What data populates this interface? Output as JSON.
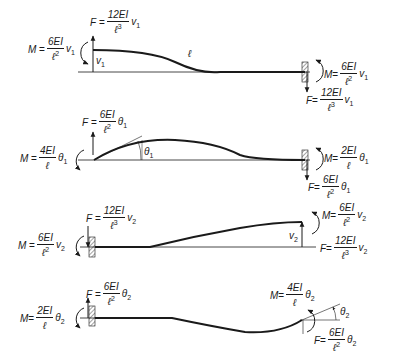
{
  "diagram": {
    "cases": [
      {
        "id": "case1",
        "description": "Left end translation v1, right end fixed",
        "span_label": "ℓ",
        "displacement_label": {
          "sym": "v",
          "sub": "1"
        },
        "left_force": {
          "sym": "F",
          "num": "12EI",
          "den": "ℓ",
          "den_pow": "3",
          "var": "v",
          "var_sub": "1"
        },
        "left_moment": {
          "sym": "M",
          "num": "6EI",
          "den": "ℓ",
          "den_pow": "2",
          "var": "v",
          "var_sub": "1"
        },
        "right_moment": {
          "sym": "M",
          "num": "6EI",
          "den": "ℓ",
          "den_pow": "2",
          "var": "v",
          "var_sub": "1"
        },
        "right_force": {
          "sym": "F",
          "num": "12EI",
          "den": "ℓ",
          "den_pow": "3",
          "var": "v",
          "var_sub": "1"
        }
      },
      {
        "id": "case2",
        "description": "Left end rotation θ1, right end fixed",
        "displacement_label": {
          "sym": "θ",
          "sub": "1"
        },
        "left_force": {
          "sym": "F",
          "num": "6EI",
          "den": "ℓ",
          "den_pow": "2",
          "var": "θ",
          "var_sub": "1"
        },
        "left_moment": {
          "sym": "M",
          "num": "4EI",
          "den": "ℓ",
          "den_pow": "",
          "var": "θ",
          "var_sub": "1"
        },
        "right_moment": {
          "sym": "M",
          "num": "2EI",
          "den": "ℓ",
          "den_pow": "",
          "var": "θ",
          "var_sub": "1"
        },
        "right_force": {
          "sym": "F",
          "num": "6EI",
          "den": "ℓ",
          "den_pow": "2",
          "var": "θ",
          "var_sub": "1"
        }
      },
      {
        "id": "case3",
        "description": "Right end translation v2, left end fixed",
        "displacement_label": {
          "sym": "v",
          "sub": "2"
        },
        "left_force": {
          "sym": "F",
          "num": "12EI",
          "den": "ℓ",
          "den_pow": "3",
          "var": "v",
          "var_sub": "2"
        },
        "left_moment": {
          "sym": "M",
          "num": "6EI",
          "den": "ℓ",
          "den_pow": "2",
          "var": "v",
          "var_sub": "2"
        },
        "right_moment": {
          "sym": "M",
          "num": "6EI",
          "den": "ℓ",
          "den_pow": "2",
          "var": "v",
          "var_sub": "2"
        },
        "right_force": {
          "sym": "F",
          "num": "12EI",
          "den": "ℓ",
          "den_pow": "3",
          "var": "v",
          "var_sub": "2"
        }
      },
      {
        "id": "case4",
        "description": "Right end rotation θ2, left end fixed",
        "displacement_label": {
          "sym": "θ",
          "sub": "2"
        },
        "left_force": {
          "sym": "F",
          "num": "6EI",
          "den": "ℓ",
          "den_pow": "2",
          "var": "θ",
          "var_sub": "2"
        },
        "left_moment": {
          "sym": "M",
          "num": "2EI",
          "den": "ℓ",
          "den_pow": "",
          "var": "θ",
          "var_sub": "2"
        },
        "right_moment": {
          "sym": "M",
          "num": "4EI",
          "den": "ℓ",
          "den_pow": "",
          "var": "θ",
          "var_sub": "2"
        },
        "right_force": {
          "sym": "F",
          "num": "6EI",
          "den": "ℓ",
          "den_pow": "2",
          "var": "θ",
          "var_sub": "2"
        }
      }
    ],
    "colors": {
      "ink": "#1a1a1a",
      "background": "#ffffff"
    }
  }
}
